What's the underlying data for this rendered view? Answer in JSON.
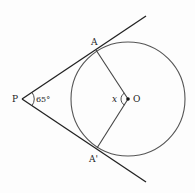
{
  "diagram": {
    "type": "geometry",
    "points": {
      "P": {
        "label": "P",
        "x": 22,
        "y": 99
      },
      "A": {
        "label": "A",
        "x": 96,
        "y": 50
      },
      "A_prime": {
        "label": "A'",
        "x": 97,
        "y": 148
      },
      "O": {
        "label": "O",
        "x": 128,
        "y": 99
      }
    },
    "circle": {
      "center": "O",
      "cx": 128,
      "cy": 99,
      "r": 57
    },
    "angles": {
      "at_P": {
        "label": "65°",
        "value": 65
      },
      "at_O": {
        "label": "x",
        "value": null
      }
    },
    "lines": [
      {
        "name": "tangent-PA",
        "from": "P",
        "to": "A",
        "extends_to": [
          146,
          16
        ]
      },
      {
        "name": "tangent-PA-prime",
        "from": "P",
        "to": "A_prime",
        "extends_to": [
          146,
          182
        ]
      },
      {
        "name": "radius-OA",
        "from": "O",
        "to": "A"
      },
      {
        "name": "radius-OA-prime",
        "from": "O",
        "to": "A_prime"
      }
    ],
    "colors": {
      "tangent_stroke": "#222222",
      "circle_stroke": "#555555",
      "radius_stroke": "#444444",
      "label": "#222222",
      "background": "#fdfdfd"
    }
  }
}
